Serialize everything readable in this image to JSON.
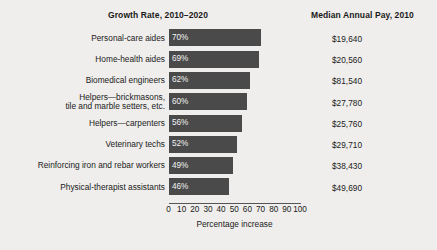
{
  "headers": {
    "growth": "Growth Rate, 2010–2020",
    "pay": "Median Annual Pay, 2010"
  },
  "axis": {
    "title": "Percentage increase",
    "ticks": [
      "0",
      "10",
      "20",
      "30",
      "40",
      "50",
      "60",
      "70",
      "80",
      "90",
      "100"
    ]
  },
  "colors": {
    "bar": "#4a4a4a",
    "background": "#efeeec",
    "bar_label": "#f2f2f2"
  },
  "chart_data": {
    "type": "bar",
    "orientation": "horizontal",
    "title": "Growth Rate, 2010–2020",
    "xlabel": "Percentage increase",
    "ylabel": "",
    "xlim": [
      0,
      100
    ],
    "grid": false,
    "legend": "none",
    "categories": [
      "Personal-care aides",
      "Home-health aides",
      "Biomedical engineers",
      "Helpers—brickmasons,\ntile and marble setters, etc.",
      "Helpers—carpenters",
      "Veterinary techs",
      "Reinforcing iron and rebar workers",
      "Physical-therapist assistants"
    ],
    "values": [
      70,
      69,
      62,
      60,
      56,
      52,
      49,
      46
    ],
    "data_labels": [
      "70%",
      "69%",
      "62%",
      "60%",
      "56%",
      "52%",
      "49%",
      "46%"
    ],
    "secondary_column": {
      "name": "Median Annual Pay, 2010",
      "values": [
        "$19,640",
        "$20,560",
        "$81,540",
        "$27,780",
        "$25,760",
        "$29,710",
        "$38,430",
        "$49,690"
      ]
    }
  }
}
